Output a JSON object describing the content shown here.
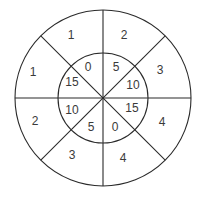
{
  "diagram": {
    "type": "segmented-circle",
    "center": [
      103,
      98
    ],
    "outer_radius": 88,
    "inner_radius": 45,
    "line_color": "#2a2a2a",
    "text_color": "#3a3a3a",
    "outer_ring": {
      "labels": [
        {
          "id": "nnw",
          "text": "1",
          "x": 71,
          "y": 35
        },
        {
          "id": "nne",
          "text": "2",
          "x": 124,
          "y": 35
        },
        {
          "id": "ene",
          "text": "3",
          "x": 160,
          "y": 70
        },
        {
          "id": "ese",
          "text": "4",
          "x": 162,
          "y": 122
        },
        {
          "id": "sse",
          "text": "4",
          "x": 123,
          "y": 158
        },
        {
          "id": "ssw",
          "text": "3",
          "x": 72,
          "y": 155
        },
        {
          "id": "wsw",
          "text": "2",
          "x": 35,
          "y": 121
        },
        {
          "id": "wnw",
          "text": "1",
          "x": 33,
          "y": 72
        }
      ]
    },
    "inner_ring": {
      "labels": [
        {
          "id": "nnw",
          "text": "0",
          "x": 88,
          "y": 67
        },
        {
          "id": "nne",
          "text": "5",
          "x": 116,
          "y": 67
        },
        {
          "id": "ene",
          "text": "10",
          "x": 133,
          "y": 85
        },
        {
          "id": "ese",
          "text": "15",
          "x": 132,
          "y": 108
        },
        {
          "id": "sse",
          "text": "0",
          "x": 115,
          "y": 127
        },
        {
          "id": "ssw",
          "text": "5",
          "x": 91,
          "y": 127
        },
        {
          "id": "wsw",
          "text": "10",
          "x": 72,
          "y": 110
        },
        {
          "id": "wnw",
          "text": "15",
          "x": 72,
          "y": 82
        }
      ]
    }
  }
}
